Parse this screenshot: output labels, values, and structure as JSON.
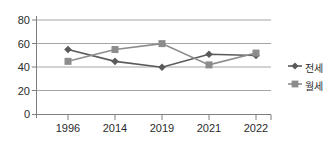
{
  "chart_data": {
    "type": "line",
    "title": "",
    "xlabel": "",
    "ylabel": "",
    "categories": [
      "1996",
      "2014",
      "2019",
      "2021",
      "2022"
    ],
    "series": [
      {
        "name": "전세",
        "marker": "diamond",
        "color": "#5a5a5a",
        "values": [
          55,
          45,
          40,
          51,
          50
        ]
      },
      {
        "name": "월세",
        "marker": "square",
        "color": "#8c8c8c",
        "values": [
          45,
          55,
          60,
          42,
          52
        ]
      }
    ],
    "ylim": [
      0,
      80
    ],
    "yticks": [
      0,
      20,
      40,
      60,
      80
    ],
    "ytick_labels": [
      "0",
      "20",
      "40",
      "60",
      "80"
    ],
    "grid": true,
    "legend_position": "right"
  },
  "axis": {
    "y_labels": [
      "80",
      "60",
      "40",
      "20",
      "0"
    ],
    "x_labels": [
      "1996",
      "2014",
      "2019",
      "2021",
      "2022"
    ]
  },
  "legend": {
    "entries": [
      {
        "label": "전세",
        "marker": "diamond-marker-icon"
      },
      {
        "label": "월세",
        "marker": "square-marker-icon"
      }
    ]
  },
  "colors": {
    "series_jeonse": "#5a5a5a",
    "series_wolse": "#8c8c8c",
    "grid": "#a6a6a6",
    "axis": "#7f7f7f",
    "text": "#2b2b2b",
    "background": "#ffffff"
  }
}
